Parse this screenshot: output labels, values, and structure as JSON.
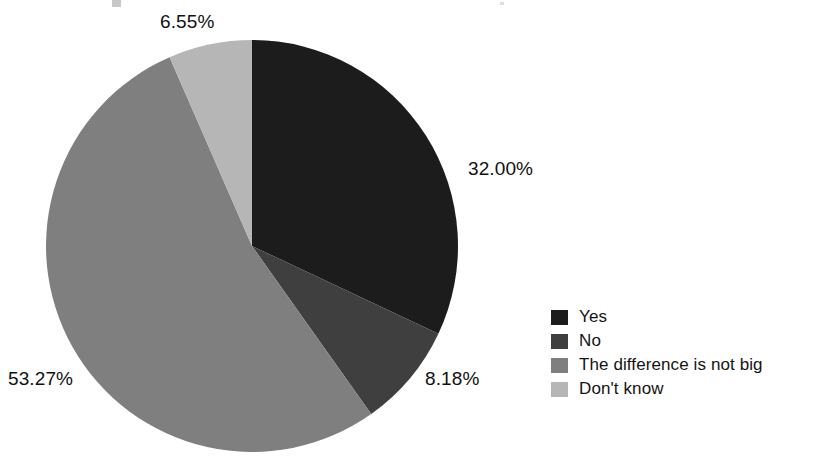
{
  "chart_data": {
    "type": "pie",
    "title": "",
    "categories": [
      "Yes",
      "No",
      "The difference is not big",
      "Don't know"
    ],
    "values": [
      32.0,
      8.18,
      53.27,
      6.55
    ],
    "value_labels": [
      "32.00%",
      "8.18%",
      "53.27%",
      "6.55%"
    ],
    "unit": "%",
    "colors": [
      "#1c1c1c",
      "#3f3f3f",
      "#7f7f7f",
      "#b6b6b6"
    ],
    "start_angle_deg": 0,
    "direction": "clockwise",
    "legend_position": "right",
    "grid": false,
    "xlabel": "",
    "ylabel": ""
  },
  "legend": {
    "items": [
      {
        "label": "Yes",
        "color": "#1c1c1c",
        "value_label": "32.00%"
      },
      {
        "label": "No",
        "color": "#3f3f3f",
        "value_label": "8.18%"
      },
      {
        "label": "The difference is not big",
        "color": "#7f7f7f",
        "value_label": "53.27%"
      },
      {
        "label": "Don't know",
        "color": "#b6b6b6",
        "value_label": "6.55%"
      }
    ]
  },
  "labels": {
    "yes": "32.00%",
    "no": "8.18%",
    "difference": "53.27%",
    "dont_know": "6.55%"
  }
}
